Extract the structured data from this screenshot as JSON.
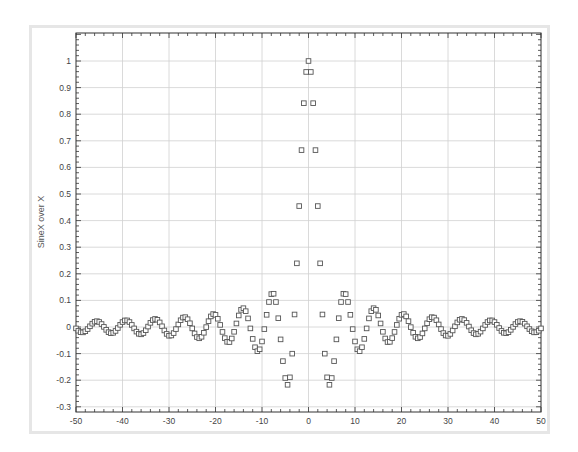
{
  "chart_data": {
    "type": "scatter",
    "title": "",
    "xlabel": "",
    "ylabel": "SineX over X",
    "xlim": [
      -50,
      50
    ],
    "ylim": [
      -0.31,
      1.1
    ],
    "grid": true,
    "legend": null,
    "x_ticks": [
      -50,
      -40,
      -30,
      -20,
      -10,
      0,
      10,
      20,
      30,
      40,
      50
    ],
    "y_ticks": [
      -0.3,
      -0.2,
      -0.1,
      0,
      0.1,
      0.2,
      0.3,
      0.4,
      0.5,
      0.6,
      0.7,
      0.8,
      0.9,
      1
    ],
    "x_tick_labels": [
      "-50",
      "-40",
      "-30",
      "-20",
      "-10",
      "0",
      "10",
      "20",
      "30",
      "40",
      "50"
    ],
    "y_tick_labels": [
      "-0.3",
      "-0.2",
      "-0.1",
      "0",
      "0.1",
      "0.2",
      "0.3",
      "0.4",
      "0.5",
      "0.6",
      "0.7",
      "0.8",
      "0.9",
      "1"
    ],
    "marker": "open-square",
    "marker_color": "#555555",
    "series": [
      {
        "name": "sin(x)/x",
        "x_start": -50,
        "x_end": 50,
        "x_step": 0.5,
        "formula": "sin(x)/x",
        "sample_points": [
          {
            "x": -3,
            "y": 0.047
          },
          {
            "x": -2.5,
            "y": 0.239
          },
          {
            "x": -2,
            "y": 0.455
          },
          {
            "x": -1.5,
            "y": 0.665
          },
          {
            "x": -1,
            "y": 0.841
          },
          {
            "x": -0.5,
            "y": 0.959
          },
          {
            "x": 0,
            "y": 1.0
          },
          {
            "x": 0.5,
            "y": 0.959
          },
          {
            "x": 1,
            "y": 0.841
          },
          {
            "x": 1.5,
            "y": 0.665
          },
          {
            "x": 2,
            "y": 0.455
          },
          {
            "x": 2.5,
            "y": 0.239
          },
          {
            "x": 3,
            "y": 0.047
          },
          {
            "x": -4.5,
            "y": -0.217
          },
          {
            "x": 4.5,
            "y": -0.217
          },
          {
            "x": -7.5,
            "y": 0.125
          },
          {
            "x": 7.5,
            "y": 0.125
          }
        ]
      }
    ]
  },
  "colors": {
    "frame": "#e6e6e6",
    "grid": "#d0d0d0",
    "axis": "#333333",
    "marker": "#555555"
  }
}
